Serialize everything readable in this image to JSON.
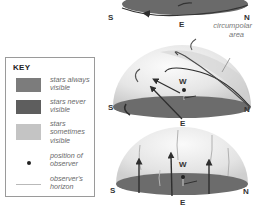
{
  "key": {
    "title": "KEY",
    "items": [
      {
        "label_line1": "stars always",
        "label_line2": "visible",
        "swatch_color": "#7c7c7c",
        "type": "swatch"
      },
      {
        "label_line1": "stars never",
        "label_line2": "visible",
        "swatch_color": "#5e5e5e",
        "type": "swatch"
      },
      {
        "label_line1": "stars",
        "label_line2": "sometimes",
        "label_line3": "visible",
        "swatch_color": "#c4c4c4",
        "type": "swatch"
      },
      {
        "label_line1": "position of",
        "label_line2": "observer",
        "type": "dot"
      },
      {
        "label_line1": "observer's",
        "label_line2": "horizon",
        "type": "line"
      }
    ]
  },
  "diagrams": [
    {
      "name": "pole",
      "labels": {
        "s": "S",
        "e": "E",
        "n": "N"
      }
    },
    {
      "name": "mid-latitude",
      "labels": {
        "s": "S",
        "w": "W",
        "e": "E",
        "n": "N"
      },
      "annotation_line1": "circumpolar",
      "annotation_line2": "area"
    },
    {
      "name": "equator",
      "labels": {
        "s": "S",
        "w": "W",
        "e": "E",
        "n": "N"
      }
    }
  ],
  "colors": {
    "disc": "#6a6a6a",
    "dome_light": "#f4f4f4",
    "dome_mid": "#d9d9d9",
    "trail": "#3a3a3a"
  }
}
